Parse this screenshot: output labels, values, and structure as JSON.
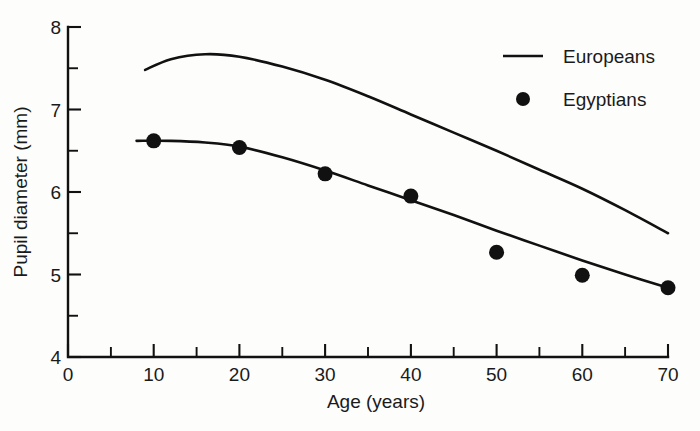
{
  "chart_data": {
    "type": "line",
    "title": "",
    "xlabel": "Age (years)",
    "ylabel": "Pupil diameter (mm)",
    "xlim": [
      0,
      70
    ],
    "ylim": [
      4,
      8
    ],
    "x_ticks": [
      0,
      10,
      20,
      30,
      40,
      50,
      60,
      70
    ],
    "x_tick_labels": [
      "0",
      "10",
      "20",
      "30",
      "40",
      "50",
      "60",
      "70"
    ],
    "x_minor_ticks": [
      5,
      15,
      25,
      35,
      45,
      55,
      65
    ],
    "y_ticks": [
      4,
      5,
      6,
      7,
      8
    ],
    "y_tick_labels": [
      "4",
      "5",
      "6",
      "7",
      "8"
    ],
    "y_minor_ticks": [
      4.5,
      5.5,
      6.5,
      7.5
    ],
    "grid": false,
    "legend_position": "top-right",
    "line_color": "#111111",
    "marker_color": "#111111",
    "background_color": "#fdfdfc",
    "series": [
      {
        "name": "Europeans",
        "style": "line",
        "marker": "none",
        "x": [
          9,
          12,
          16,
          20,
          25,
          30,
          35,
          40,
          45,
          50,
          55,
          60,
          65,
          70
        ],
        "values": [
          7.48,
          7.61,
          7.67,
          7.64,
          7.52,
          7.36,
          7.16,
          6.94,
          6.72,
          6.5,
          6.27,
          6.04,
          5.78,
          5.5
        ]
      },
      {
        "name": "Egyptians",
        "style": "line+markers",
        "marker": "filled-circle",
        "x": [
          10,
          20,
          30,
          40,
          50,
          60,
          70
        ],
        "values": [
          6.62,
          6.54,
          6.22,
          5.95,
          5.27,
          4.99,
          4.84
        ],
        "fit_curve_x": [
          8,
          12,
          16,
          20,
          25,
          30,
          35,
          40,
          45,
          50,
          55,
          60,
          65,
          70
        ],
        "fit_curve_values": [
          6.62,
          6.62,
          6.6,
          6.55,
          6.42,
          6.26,
          6.08,
          5.9,
          5.72,
          5.53,
          5.35,
          5.17,
          5.0,
          4.84
        ]
      }
    ],
    "legend": [
      {
        "label": "Europeans",
        "marker": "line"
      },
      {
        "label": "Egyptians",
        "marker": "filled-circle"
      }
    ]
  },
  "axes": {
    "y_title": "Pupil diameter (mm)",
    "x_title": "Age (years)"
  },
  "legend_items": {
    "europeans": "Europeans",
    "egyptians": "Egyptians"
  },
  "y_labels": {
    "t4": "4",
    "t5": "5",
    "t6": "6",
    "t7": "7",
    "t8": "8"
  },
  "x_labels": {
    "t0": "0",
    "t10": "10",
    "t20": "20",
    "t30": "30",
    "t40": "40",
    "t50": "50",
    "t60": "60",
    "t70": "70"
  }
}
